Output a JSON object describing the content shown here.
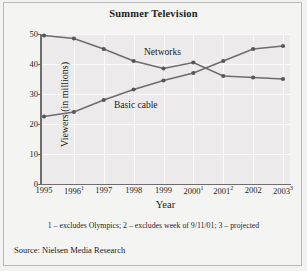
{
  "figure": {
    "title": "Summer Television",
    "xlabel": "Year",
    "ylabel": "Viewers (in millions)",
    "footnote": "1 – excludes Olympics; 2 – excludes week of 9/11/01; 3 – projected",
    "source": "Source: Nielsen Media Research"
  },
  "labels": {
    "networks": "Networks",
    "basic_cable": "Basic cable"
  },
  "yticks": [
    "0",
    "10",
    "20",
    "30",
    "40",
    "50"
  ],
  "xticks": [
    {
      "year": "1995",
      "note": ""
    },
    {
      "year": "1996",
      "note": "1"
    },
    {
      "year": "1997",
      "note": ""
    },
    {
      "year": "1998",
      "note": ""
    },
    {
      "year": "1999",
      "note": ""
    },
    {
      "year": "2000",
      "note": "1"
    },
    {
      "year": "2001",
      "note": "2"
    },
    {
      "year": "2002",
      "note": ""
    },
    {
      "year": "2003",
      "note": "3"
    }
  ],
  "colors": {
    "line": "#6d6d6d",
    "marker": "#575757",
    "plot_background": "#eceaea",
    "gridline": "#fbfbfb",
    "text": "#1b1b1b"
  },
  "chart_data": {
    "type": "line",
    "title": "Summer Television",
    "xlabel": "Year",
    "ylabel": "Viewers (in millions)",
    "categories": [
      "1995",
      "1996",
      "1997",
      "1998",
      "1999",
      "2000",
      "2001",
      "2002",
      "2003"
    ],
    "series": [
      {
        "name": "Networks",
        "values": [
          49.5,
          48.5,
          45.0,
          41.0,
          38.5,
          40.5,
          36.0,
          35.5,
          35.0
        ]
      },
      {
        "name": "Basic cable",
        "values": [
          22.5,
          24.0,
          28.0,
          31.5,
          34.5,
          37.0,
          41.0,
          45.0,
          46.0
        ]
      }
    ],
    "ylim": [
      0,
      50
    ],
    "yticks": [
      0,
      10,
      20,
      30,
      40,
      50
    ],
    "grid": true,
    "legend": "inline-labels",
    "footnote": "1 – excludes Olympics; 2 – excludes week of 9/11/01; 3 – projected",
    "source": "Source: Nielsen Media Research"
  }
}
